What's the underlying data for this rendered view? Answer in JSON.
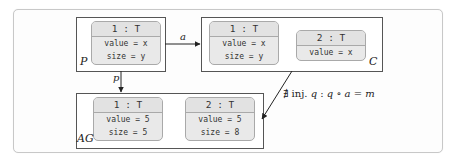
{
  "graphs": {
    "P": {
      "label": "P",
      "nodes": [
        {
          "title": "1 : T",
          "attrs": [
            "value = x",
            "size = y"
          ]
        }
      ]
    },
    "C": {
      "label": "C",
      "nodes": [
        {
          "title": "1 : T",
          "attrs": [
            "value = x",
            "size = y"
          ]
        },
        {
          "title": "2 : T",
          "attrs": [
            "value = x"
          ]
        }
      ]
    },
    "AG": {
      "label": "AG",
      "nodes": [
        {
          "title": "1 : T",
          "attrs": [
            "value = 5",
            "size = 5"
          ]
        },
        {
          "title": "2 : T",
          "attrs": [
            "value = 5",
            "size = 8"
          ]
        }
      ]
    }
  },
  "edges": {
    "a": {
      "label": "a",
      "from": "P",
      "to": "C"
    },
    "p": {
      "label": "p",
      "from": "P",
      "to": "AG"
    },
    "m": {
      "from": "C",
      "to": "AG"
    }
  },
  "constraint": {
    "symbol": "∄",
    "text_plain": " inj. ",
    "var_q": "q",
    "colon": " : ",
    "expr_q": "q",
    "compose": " ∘ ",
    "expr_a": "a",
    "equals": " = ",
    "expr_m": "m"
  }
}
